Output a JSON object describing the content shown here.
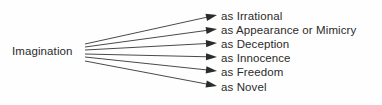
{
  "diagram": {
    "type": "fan-node-link",
    "background_color": "#fefefe",
    "line_color": "#4a4a4a",
    "arrow_color": "#2b2b2b",
    "text_color": "#2b2b2b",
    "source": {
      "label": "Imagination",
      "x": 12,
      "y": 44
    },
    "origin": {
      "x": 85,
      "y_top": 44,
      "y_bottom": 61
    },
    "branches": [
      {
        "label": "as Irrational",
        "origin_y": 44,
        "tip_x": 217,
        "tip_y": 15,
        "text_y": 9
      },
      {
        "label": "as Appearance or Mimicry",
        "origin_y": 47,
        "tip_x": 217,
        "tip_y": 29,
        "text_y": 23
      },
      {
        "label": "as Deception",
        "origin_y": 50,
        "tip_x": 217,
        "tip_y": 43,
        "text_y": 37
      },
      {
        "label": "as Innocence",
        "origin_y": 54,
        "tip_x": 217,
        "tip_y": 57,
        "text_y": 51
      },
      {
        "label": "as Freedom",
        "origin_y": 57,
        "tip_x": 217,
        "tip_y": 71,
        "text_y": 65
      },
      {
        "label": "as Novel",
        "origin_y": 61,
        "tip_x": 217,
        "tip_y": 86,
        "text_y": 80
      }
    ]
  }
}
